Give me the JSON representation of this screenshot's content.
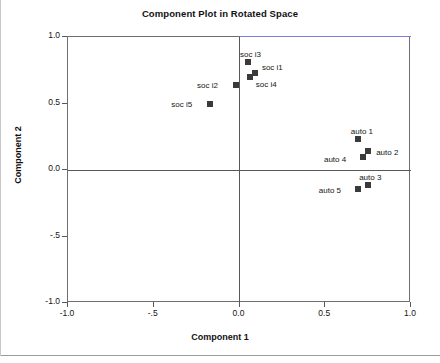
{
  "chart_data": {
    "type": "scatter",
    "title": "Component Plot in Rotated Space",
    "xlabel": "Component 1",
    "ylabel": "Component 2",
    "xlim": [
      -1.0,
      1.0
    ],
    "ylim": [
      -1.0,
      1.0
    ],
    "xticks": [
      -1.0,
      -0.5,
      0.0,
      0.5,
      1.0
    ],
    "yticks": [
      -1.0,
      -0.5,
      0.0,
      0.5,
      1.0
    ],
    "xtick_labels": [
      "-1.0",
      "-.5",
      "0.0",
      "0.5",
      "1.0"
    ],
    "ytick_labels": [
      "-1.0",
      "-.5",
      "0.0",
      "0.5",
      "1.0"
    ],
    "grid": false,
    "legend": null,
    "marker_color": "#3a3a3a",
    "marker_shape": "square",
    "points": [
      {
        "label": "soc i3",
        "x": 0.05,
        "y": 0.81,
        "label_dx": -8,
        "label_dy": -12
      },
      {
        "label": "soc i1",
        "x": 0.09,
        "y": 0.73,
        "label_dx": 7,
        "label_dy": -10
      },
      {
        "label": "soc i4",
        "x": 0.06,
        "y": 0.7,
        "label_dx": 6,
        "label_dy": 3
      },
      {
        "label": "soc i2",
        "x": -0.02,
        "y": 0.64,
        "label_dx": -39,
        "label_dy": -4
      },
      {
        "label": "soc i5",
        "x": -0.17,
        "y": 0.5,
        "label_dx": -39,
        "label_dy": -4
      },
      {
        "label": "auto 1",
        "x": 0.69,
        "y": 0.23,
        "label_dx": -7,
        "label_dy": -12
      },
      {
        "label": "auto 2",
        "x": 0.75,
        "y": 0.14,
        "label_dx": 8,
        "label_dy": -3
      },
      {
        "label": "auto 4",
        "x": 0.72,
        "y": 0.1,
        "label_dx": -39,
        "label_dy": -2
      },
      {
        "label": "auto 3",
        "x": 0.75,
        "y": -0.11,
        "label_dx": -9,
        "label_dy": -12
      },
      {
        "label": "auto 5",
        "x": 0.69,
        "y": -0.14,
        "label_dx": -39,
        "label_dy": -3
      }
    ]
  },
  "figure": {
    "title": "Component Plot in Rotated Space",
    "axis_x_title": "Component 1",
    "axis_y_title": "Component 2",
    "frame_color": "#6f6f6f",
    "accent_color": "#7d7ddd",
    "background": "#ffffff"
  }
}
